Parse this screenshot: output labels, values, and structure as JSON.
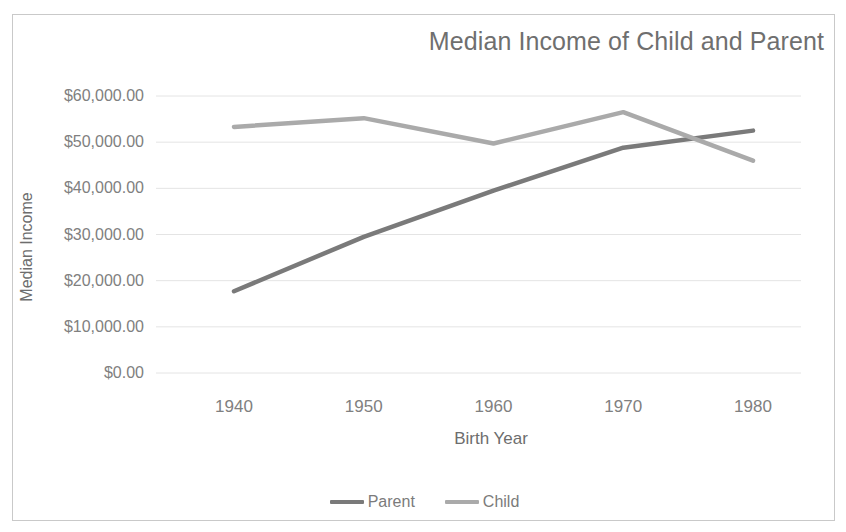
{
  "chart_data": {
    "type": "line",
    "title": "Median Income of Child and Parent",
    "xlabel": "Birth  Year",
    "ylabel": "Median Income",
    "categories": [
      "1940",
      "1950",
      "1960",
      "1970",
      "1980"
    ],
    "x": [
      1940,
      1950,
      1960,
      1970,
      1980
    ],
    "xlim": [
      1935,
      1985
    ],
    "ylim": [
      0,
      60000
    ],
    "ytick_labels": [
      "$60,000.00",
      "$50,000.00",
      "$40,000.00",
      "$30,000.00",
      "$20,000.00",
      "$10,000.00",
      "$0.00"
    ],
    "ytick_values": [
      60000,
      50000,
      40000,
      30000,
      20000,
      10000,
      0
    ],
    "grid": "horizontal",
    "legend_position": "bottom",
    "series": [
      {
        "name": "Parent",
        "color": "#7a7a7a",
        "values": [
          17700,
          29500,
          39500,
          48800,
          52500
        ]
      },
      {
        "name": "Child",
        "color": "#aaaaaa",
        "values": [
          53300,
          55200,
          49700,
          56500,
          46000
        ]
      }
    ]
  },
  "colors": {
    "frame_border": "#c9c9c9",
    "gridline": "#e4e4e4",
    "title_text": "#6f6f6f",
    "axis_text": "#808080",
    "background": "#ffffff"
  }
}
